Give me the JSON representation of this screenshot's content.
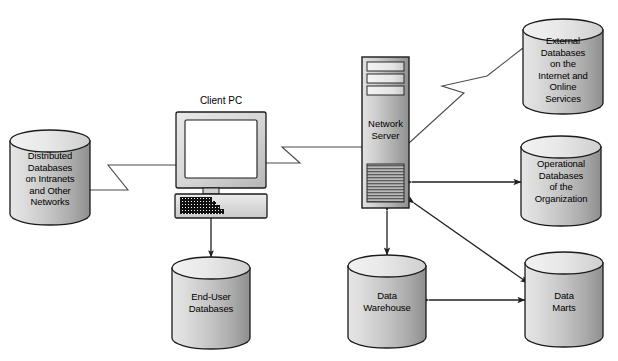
{
  "diagram": {
    "background_color": "#ffffff",
    "line_color": "#3a3a3a",
    "text_color": "#000000",
    "nodes": {
      "distributed_db": {
        "label": "Distributed\nDatabases\non Intranets\nand Other\nNetworks",
        "shape": "cylinder"
      },
      "client_pc": {
        "label": "Client PC",
        "shape": "computer"
      },
      "network_server": {
        "label": "Network\nServer",
        "shape": "server-tower"
      },
      "external_db": {
        "label": "External\nDatabases\non the\nInternet and\nOnline\nServices",
        "shape": "cylinder"
      },
      "operational_db": {
        "label": "Operational\nDatabases\nof the\nOrganization",
        "shape": "cylinder"
      },
      "end_user_db": {
        "label": "End-User\nDatabases",
        "shape": "cylinder"
      },
      "data_warehouse": {
        "label": "Data\nWarehouse",
        "shape": "cylinder"
      },
      "data_marts": {
        "label": "Data\nMarts",
        "shape": "cylinder"
      }
    },
    "connectors": [
      {
        "name": "distributed-db-to-client-pc",
        "style": "zigzag-link",
        "arrows": "none"
      },
      {
        "name": "client-pc-to-network-server",
        "style": "zigzag-link",
        "arrows": "none"
      },
      {
        "name": "network-server-to-external-db",
        "style": "zigzag-link",
        "arrows": "none"
      },
      {
        "name": "network-server-to-operational-db",
        "style": "straight",
        "arrows": "both"
      },
      {
        "name": "network-server-to-data-marts",
        "style": "straight",
        "arrows": "both"
      },
      {
        "name": "network-server-to-data-warehouse",
        "style": "straight",
        "arrows": "both"
      },
      {
        "name": "data-warehouse-to-data-marts",
        "style": "straight",
        "arrows": "both"
      },
      {
        "name": "client-pc-to-end-user-db",
        "style": "straight",
        "arrows": "both"
      }
    ]
  }
}
